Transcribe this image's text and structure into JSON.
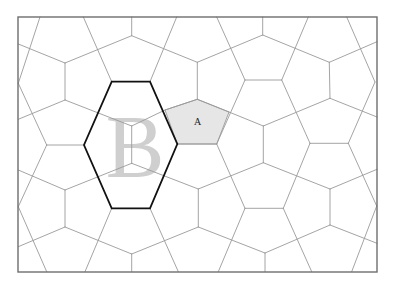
{
  "diagram": {
    "type": "cairo-pentagonal-tiling",
    "labels": {
      "highlighted_tile": "A",
      "outlined_region": "B"
    },
    "colors": {
      "background": "#ffffff",
      "edge": "#9a9a9a",
      "frame": "#6e6e6e",
      "hexagon_outline": "#111111",
      "tile_a_fill": "#e6e6e6",
      "letter_b": "#cfcfcf",
      "letter_a": "#222222"
    }
  }
}
